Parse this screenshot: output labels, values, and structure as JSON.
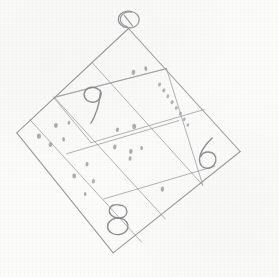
{
  "canvas": {
    "width": 279,
    "height": 277,
    "background_color": "#fcfcfb",
    "medium": "pencil-on-paper-sketch",
    "title": "Hand-drawn rotated 3x3 grid with digits and dot marks"
  },
  "ink": {
    "line_color": "#8d8d92",
    "digit_color": "#86868c",
    "dot_color": "#9d9da3"
  },
  "figure": {
    "shape": "square-grid",
    "rows": 3,
    "columns": 3,
    "rotation_degrees": 40,
    "corners": {
      "top": "128,28",
      "right": "240,152",
      "bottom": "113,253",
      "left": "17,133"
    }
  },
  "loop_marker": {
    "label": "circle-loop",
    "position": "129,25",
    "radius": 9
  },
  "digits": [
    {
      "value": "9",
      "cell": "row1-col1",
      "x": 95,
      "y": 100
    },
    {
      "value": "6",
      "cell": "row2-col3",
      "x": 208,
      "y": 155
    },
    {
      "value": "8",
      "cell": "row3-col2",
      "x": 117,
      "y": 218
    }
  ],
  "dotted_line": {
    "cell": "row1-col3",
    "dot_count": 8,
    "start": "159,84",
    "end": "188,125"
  },
  "dot_marks": [
    {
      "cell": "row1-col2",
      "count": 2
    },
    {
      "cell": "row2-col1",
      "count": 5
    },
    {
      "cell": "row2-col2",
      "count": 6
    },
    {
      "cell": "row3-col1",
      "count": 4
    },
    {
      "cell": "row3-col3",
      "count": 1
    }
  ],
  "notes": {
    "caption": "pencil sketch: tilted 3x3 box grid, small loop at apex, numerals 9, 6, 8 and scattered dots"
  }
}
